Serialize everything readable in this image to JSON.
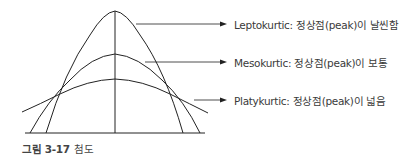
{
  "figure": {
    "caption_number": "그림 3-17",
    "caption_title": "첨도"
  },
  "curves": [
    {
      "name": "leptokurtic",
      "label": "Leptokurtic: 정상점(peak)이 날씬함"
    },
    {
      "name": "mesokurtic",
      "label": "Mesokurtic: 정상점(peak)이 보통"
    },
    {
      "name": "platykurtic",
      "label": "Platykurtic: 정상점(peak)이 넓음"
    }
  ],
  "colors": {
    "line": "#222222",
    "text": "#3a3a3a"
  }
}
